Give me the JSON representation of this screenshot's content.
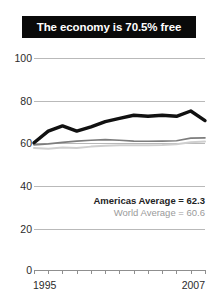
{
  "title": {
    "text": "The economy is 70.5% free",
    "background": "#0a0a0a",
    "color": "#ffffff"
  },
  "legend": {
    "americas": "Americas Average = 62.3",
    "world": "World Average = 60.6"
  },
  "axis": {
    "y_ticks": [
      "100",
      "80",
      "60",
      "40",
      "20",
      "0"
    ],
    "x_start_label": "1995",
    "x_end_label": "2007"
  },
  "colors": {
    "country_line": "#111111",
    "americas_line": "#7d7d7d",
    "world_line": "#cfcfcf",
    "grid": "#b9b9b9",
    "text": "#2b2b2b",
    "legend_world_text": "#9a9a9a"
  },
  "chart_data": {
    "type": "line",
    "title": "The economy is 70.5% free",
    "xlabel": "",
    "ylabel": "",
    "ylim": [
      0,
      100
    ],
    "yticks": [
      0,
      20,
      40,
      60,
      80,
      100
    ],
    "grid": true,
    "legend_position": "inside-right",
    "x": [
      1995,
      1996,
      1997,
      1998,
      1999,
      2000,
      2001,
      2002,
      2003,
      2004,
      2005,
      2006,
      2007
    ],
    "series": [
      {
        "name": "Country",
        "style": "thick-black",
        "values": [
          60.0,
          65.5,
          68.0,
          65.5,
          67.5,
          70.0,
          71.5,
          73.0,
          72.5,
          73.0,
          72.5,
          75.0,
          70.5
        ]
      },
      {
        "name": "Americas Average",
        "style": "medium-gray",
        "final_value": 62.3,
        "values": [
          59.0,
          59.5,
          60.2,
          60.8,
          61.2,
          61.5,
          61.2,
          60.8,
          60.7,
          60.8,
          61.0,
          62.2,
          62.3
        ]
      },
      {
        "name": "World Average",
        "style": "light-gray",
        "final_value": 60.6,
        "values": [
          57.5,
          57.2,
          57.8,
          57.5,
          58.2,
          58.6,
          58.8,
          58.8,
          58.9,
          59.0,
          59.3,
          60.3,
          60.6
        ]
      }
    ],
    "annotations": [
      "Americas Average = 62.3",
      "World Average = 60.6"
    ]
  }
}
